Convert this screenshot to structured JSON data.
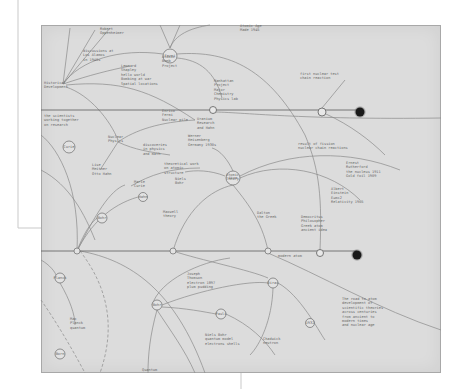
{
  "canvas": {
    "width": 464,
    "height": 389,
    "background": "#ffffff"
  },
  "paper": {
    "x": 41,
    "y": 25,
    "width": 400,
    "height": 348,
    "fill": "#dcdcdc",
    "stroke": "#a8a8a8"
  },
  "colors": {
    "ink": "#8a8a8a",
    "ink_dark": "#6a6a6a",
    "terminal": "#1a1a1a",
    "frame_line": "#c9c9c9"
  },
  "frame_lines": [
    {
      "x1": 18,
      "y1": 0,
      "x2": 18,
      "y2": 228
    },
    {
      "x1": 18,
      "y1": 228,
      "x2": 41,
      "y2": 228
    },
    {
      "x1": 241,
      "y1": 373,
      "x2": 241,
      "y2": 389
    }
  ],
  "timelines": [
    {
      "name": "upper-timeline",
      "y": 110,
      "x1": 41,
      "x2": 360
    },
    {
      "name": "lower-timeline",
      "y": 251,
      "x1": 41,
      "x2": 357
    }
  ],
  "terminal_nodes": [
    {
      "name": "upper-terminal-node",
      "x": 360,
      "y": 112,
      "r": 4.5
    },
    {
      "name": "lower-terminal-node",
      "x": 357,
      "y": 255,
      "r": 4.5
    }
  ],
  "hollow_nodes": [
    {
      "name": "upper-junction-node",
      "x": 322,
      "y": 112,
      "r": 4
    },
    {
      "name": "lower-junction-node",
      "x": 320,
      "y": 253,
      "r": 3.5
    },
    {
      "name": "upper-left-junction",
      "x": 213,
      "y": 110,
      "r": 3.5
    }
  ],
  "circle_nodes": [
    {
      "name": "node-top-hub",
      "x": 170,
      "y": 56,
      "r": 7
    },
    {
      "name": "node-central-hub",
      "x": 233,
      "y": 178,
      "r": 7
    },
    {
      "name": "node-left-circle",
      "x": 69,
      "y": 147,
      "r": 6
    },
    {
      "name": "node-mid-left",
      "x": 102,
      "y": 218,
      "r": 5
    },
    {
      "name": "node-mid-left-2",
      "x": 143,
      "y": 197,
      "r": 4.5
    },
    {
      "name": "node-left-lower",
      "x": 60,
      "y": 278,
      "r": 5
    },
    {
      "name": "node-bottom-left",
      "x": 60,
      "y": 354,
      "r": 5
    },
    {
      "name": "node-lower-center",
      "x": 157,
      "y": 305,
      "r": 5
    },
    {
      "name": "node-lower-mid",
      "x": 221,
      "y": 314,
      "r": 5
    },
    {
      "name": "node-lower-right",
      "x": 273,
      "y": 283,
      "r": 5
    },
    {
      "name": "node-bottom-right",
      "x": 310,
      "y": 323,
      "r": 4.5
    },
    {
      "name": "node-timeline-left",
      "x": 77,
      "y": 251,
      "r": 3
    },
    {
      "name": "node-timeline-mid",
      "x": 173,
      "y": 251,
      "r": 3
    },
    {
      "name": "node-timeline-right",
      "x": 268,
      "y": 251,
      "r": 3
    }
  ],
  "edges": [
    {
      "d": "M63,84 C80,60 120,48 163,54",
      "dashed": false
    },
    {
      "d": "M63,84 C90,75 110,70 130,66",
      "dashed": false
    },
    {
      "d": "M63,84 L70,28",
      "dashed": false
    },
    {
      "d": "M63,84 L95,30",
      "dashed": false
    },
    {
      "d": "M63,84 L110,28",
      "dashed": false
    },
    {
      "d": "M66,85 C120,80 150,90 195,120",
      "dashed": false
    },
    {
      "d": "M66,87 C90,95 110,120 118,140",
      "dashed": false
    },
    {
      "d": "M177,54 C230,50 270,70 305,135 C320,170 322,200 320,250",
      "dashed": false
    },
    {
      "d": "M177,58 C200,60 215,72 222,98",
      "dashed": false
    },
    {
      "d": "M170,48 L160,25",
      "dashed": false
    },
    {
      "d": "M170,48 L180,25",
      "dashed": false
    },
    {
      "d": "M170,48 C175,35 190,28 210,25",
      "dashed": false
    },
    {
      "d": "M213,112 C240,112 300,120 441,118",
      "dashed": false
    },
    {
      "d": "M118,142 C135,130 160,122 195,120",
      "dashed": false
    },
    {
      "d": "M118,142 L100,170",
      "dashed": false
    },
    {
      "d": "M118,142 C135,150 150,152 170,155",
      "dashed": false
    },
    {
      "d": "M233,185 C210,190 185,210 173,251",
      "dashed": false
    },
    {
      "d": "M233,185 C245,200 262,220 268,251",
      "dashed": false
    },
    {
      "d": "M240,178 C280,160 330,170 360,200",
      "dashed": false
    },
    {
      "d": "M240,176 C290,150 350,150 400,170",
      "dashed": false
    },
    {
      "d": "M225,176 C210,170 195,170 185,172",
      "dashed": false
    },
    {
      "d": "M233,171 C228,160 220,150 212,148",
      "dashed": false
    },
    {
      "d": "M131,186 C150,175 170,168 200,168",
      "dashed": false
    },
    {
      "d": "M77,251 C85,230 92,222 97,218",
      "dashed": false
    },
    {
      "d": "M77,251 C90,225 110,205 138,197",
      "dashed": false
    },
    {
      "d": "M77,251 C95,215 110,190 125,185",
      "dashed": false
    },
    {
      "d": "M80,251 C130,260 175,290 205,373",
      "dashed": false
    },
    {
      "d": "M80,251 C110,290 115,330 100,373",
      "dashed": true
    },
    {
      "d": "M41,300 C55,320 70,345 85,373",
      "dashed": true
    },
    {
      "d": "M60,283 C70,300 75,315 75,325",
      "dashed": false
    },
    {
      "d": "M41,260 C50,265 55,272 56,275",
      "dashed": false
    },
    {
      "d": "M173,251 C200,260 250,270 268,278",
      "dashed": false
    },
    {
      "d": "M162,305 C200,290 250,280 268,283",
      "dashed": false
    },
    {
      "d": "M152,305 C160,280 200,262 230,258",
      "dashed": false
    },
    {
      "d": "M162,307 C185,308 205,312 216,314",
      "dashed": false
    },
    {
      "d": "M157,310 C170,330 185,350 195,373",
      "dashed": false
    },
    {
      "d": "M157,310 C150,335 148,355 148,373",
      "dashed": false
    },
    {
      "d": "M226,314 C250,325 265,340 275,355",
      "dashed": false
    },
    {
      "d": "M278,283 C300,295 318,330 325,340",
      "dashed": false
    },
    {
      "d": "M273,288 C272,320 260,345 250,355",
      "dashed": false
    },
    {
      "d": "M268,253 C320,275 380,310 441,330",
      "dashed": false
    },
    {
      "d": "M41,170 C70,185 85,215 95,240",
      "dashed": false
    },
    {
      "d": "M41,135 C60,150 80,190 77,251",
      "dashed": false
    },
    {
      "d": "M322,108 L345,80",
      "dashed": false
    },
    {
      "d": "M326,114 C350,125 370,140 385,155",
      "dashed": false
    }
  ],
  "labels": [
    {
      "x": 100,
      "y": 30,
      "lines": [
        "Robert",
        "Oppenheimer"
      ]
    },
    {
      "x": 83,
      "y": 52,
      "lines": [
        "discussions at",
        "Los Alamos",
        "in 1940s"
      ]
    },
    {
      "x": 121,
      "y": 67,
      "lines": [
        "Leonard",
        "Shapley",
        "hello world",
        "Bombing at war",
        "Spatial locations"
      ]
    },
    {
      "x": 44,
      "y": 84,
      "lines": [
        "Historical",
        "Development"
      ]
    },
    {
      "x": 162,
      "y": 58,
      "lines": [
        "Atomic",
        "Bomb",
        "Project"
      ]
    },
    {
      "x": 240,
      "y": 27,
      "lines": [
        "Atomic Age",
        "Made 1945"
      ]
    },
    {
      "x": 214,
      "y": 82,
      "lines": [
        "Manhattan",
        "Project",
        "Major",
        "Chemistry",
        "Physics lab"
      ]
    },
    {
      "x": 300,
      "y": 75,
      "lines": [
        "first nuclear test",
        "chain reaction"
      ]
    },
    {
      "x": 298,
      "y": 145,
      "lines": [
        "result of fission",
        "nuclear chain reactions"
      ]
    },
    {
      "x": 44,
      "y": 117,
      "lines": [
        "the scientists",
        "working together",
        "on research"
      ]
    },
    {
      "x": 162,
      "y": 112,
      "lines": [
        "Enrico",
        "Fermi",
        "Nuclear pile"
      ]
    },
    {
      "x": 197,
      "y": 120,
      "lines": [
        "Uranium",
        "Research",
        "and Hahn"
      ]
    },
    {
      "x": 108,
      "y": 138,
      "lines": [
        "Nuclear",
        "Physics"
      ]
    },
    {
      "x": 143,
      "y": 146,
      "lines": [
        "discoveries",
        "in physics",
        "and math"
      ]
    },
    {
      "x": 188,
      "y": 137,
      "lines": [
        "Werner",
        "Heisenberg",
        "Germany 1930s"
      ]
    },
    {
      "x": 92,
      "y": 166,
      "lines": [
        "Lise",
        "Meitner",
        "Otto Hahn"
      ]
    },
    {
      "x": 164,
      "y": 165,
      "lines": [
        "theoretical work",
        "on atomic",
        "structure"
      ]
    },
    {
      "x": 134,
      "y": 183,
      "lines": [
        "Marie",
        "Curie"
      ]
    },
    {
      "x": 175,
      "y": 180,
      "lines": [
        "Niels",
        "Bohr"
      ]
    },
    {
      "x": 226,
      "y": 176,
      "lines": [
        "Atomic",
        "Theory"
      ]
    },
    {
      "x": 346,
      "y": 164,
      "lines": [
        "Ernest",
        "Rutherford",
        "the nucleus 1911",
        "Gold foil 1909"
      ]
    },
    {
      "x": 331,
      "y": 190,
      "lines": [
        "Albert",
        "Einstein",
        "E=mc2",
        "Relativity 1905"
      ]
    },
    {
      "x": 301,
      "y": 218,
      "lines": [
        "Democritus",
        "Philosopher",
        "Greek atom",
        "ancient idea"
      ]
    },
    {
      "x": 163,
      "y": 213,
      "lines": [
        "Maxwell",
        "theory"
      ]
    },
    {
      "x": 257,
      "y": 214,
      "lines": [
        "Dalton",
        "the Greek"
      ]
    },
    {
      "x": 278,
      "y": 257,
      "lines": [
        "modern atom"
      ]
    },
    {
      "x": 187,
      "y": 275,
      "lines": [
        "Joseph",
        "Thomson",
        "electron 1897",
        "plum pudding"
      ]
    },
    {
      "x": 205,
      "y": 336,
      "lines": [
        "Niels Bohr",
        "quantum model",
        "electrons shells"
      ]
    },
    {
      "x": 263,
      "y": 340,
      "lines": [
        "Chadwick",
        "neutron"
      ]
    },
    {
      "x": 342,
      "y": 300,
      "lines": [
        "The road to atom",
        "development of",
        "scientific theories",
        "across centuries",
        "from ancient to",
        "modern times",
        "and nuclear age"
      ]
    },
    {
      "x": 70,
      "y": 320,
      "lines": [
        "Max",
        "Planck",
        "quantum"
      ]
    },
    {
      "x": 142,
      "y": 371,
      "lines": [
        "Quantum"
      ]
    }
  ],
  "node_labels": [
    {
      "x": 170,
      "y": 56,
      "text": "Fermi"
    },
    {
      "x": 233,
      "y": 178,
      "text": "Atom"
    },
    {
      "x": 69,
      "y": 147,
      "text": "Curie"
    },
    {
      "x": 102,
      "y": 218,
      "text": "Bohr"
    },
    {
      "x": 143,
      "y": 197,
      "text": "Hahn"
    },
    {
      "x": 60,
      "y": 278,
      "text": "Planck"
    },
    {
      "x": 60,
      "y": 354,
      "text": "Born"
    },
    {
      "x": 157,
      "y": 305,
      "text": "Bohr"
    },
    {
      "x": 221,
      "y": 314,
      "text": "Pauli"
    },
    {
      "x": 273,
      "y": 283,
      "text": "Dirac"
    },
    {
      "x": 310,
      "y": 323,
      "text": "1932"
    }
  ]
}
